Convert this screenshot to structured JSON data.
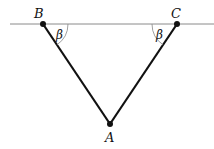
{
  "diagram": {
    "type": "geometry",
    "points": {
      "A": {
        "label": "A",
        "x": 110,
        "y": 124
      },
      "B": {
        "label": "B",
        "x": 43,
        "y": 24
      },
      "C": {
        "label": "C",
        "x": 177,
        "y": 24
      }
    },
    "baseline": {
      "x1": 10,
      "x2": 214,
      "y": 24,
      "color": "#888888"
    },
    "segments": [
      {
        "from": "B",
        "to": "A",
        "color": "#111111"
      },
      {
        "from": "C",
        "to": "A",
        "color": "#111111"
      }
    ],
    "angles": [
      {
        "vertex": "B",
        "label": "β"
      },
      {
        "vertex": "C",
        "label": "β"
      }
    ]
  }
}
